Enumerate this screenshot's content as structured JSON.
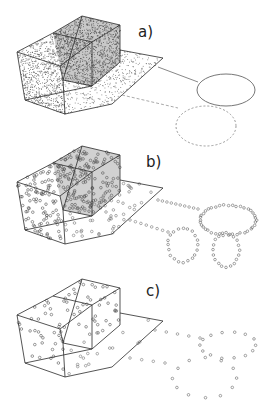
{
  "figure": {
    "width": 273,
    "height": 415,
    "background": "#ffffff",
    "line_color": "#2a2a2a",
    "point_color": "#555555",
    "panels": [
      {
        "id": "a",
        "label": "a)",
        "label_pos": [
          138,
          25
        ],
        "offset_y": 0,
        "style": "dense-shaded",
        "point_density": 1.0,
        "point_radius": 0.6,
        "circle_markers": false,
        "curves": [
          {
            "type": "ellipse",
            "cx": 226,
            "cy": 90,
            "rx": 29,
            "ry": 16,
            "stroke": "#777777",
            "dash": ""
          },
          {
            "type": "ellipse",
            "cx": 206,
            "cy": 126,
            "rx": 30,
            "ry": 20,
            "stroke": "#999999",
            "dash": "2,2"
          },
          {
            "type": "line",
            "x1": 158,
            "y1": 67,
            "x2": 198,
            "y2": 82,
            "stroke": "#888888",
            "dash": ""
          },
          {
            "type": "line",
            "x1": 122,
            "y1": 95,
            "x2": 178,
            "y2": 108,
            "stroke": "#aaaaaa",
            "dash": "3,2"
          }
        ]
      },
      {
        "id": "b",
        "label": "b)",
        "label_pos": [
          146,
          155
        ],
        "offset_y": 130,
        "style": "dense-circles",
        "point_density": 0.8,
        "point_radius": 1.3,
        "circle_markers": true,
        "curve_points": [
          {
            "cx": 228,
            "cy": 220,
            "rx": 28,
            "ry": 15,
            "n": 40
          },
          {
            "cx": 183,
            "cy": 245,
            "rx": 15,
            "ry": 17,
            "n": 20
          },
          {
            "cx": 226,
            "cy": 250,
            "rx": 13,
            "ry": 17,
            "n": 20
          },
          {
            "line": [
              158,
              200,
              198,
              209
            ],
            "n": 10
          },
          {
            "line": [
              130,
              220,
              168,
              232
            ],
            "n": 8
          }
        ]
      },
      {
        "id": "c",
        "label": "c)",
        "label_pos": [
          146,
          284
        ],
        "offset_y": 263,
        "style": "sparse-circles",
        "point_density": 0.25,
        "point_radius": 1.3,
        "circle_markers": true,
        "curve_points": [
          {
            "cx": 228,
            "cy": 345,
            "rx": 28,
            "ry": 13,
            "n": 14
          },
          {
            "cx": 205,
            "cy": 378,
            "rx": 32,
            "ry": 20,
            "n": 12
          },
          {
            "line": [
              155,
              330,
              200,
              338
            ],
            "n": 5
          },
          {
            "line": [
              130,
              358,
              165,
              363
            ],
            "n": 4
          }
        ]
      }
    ]
  }
}
